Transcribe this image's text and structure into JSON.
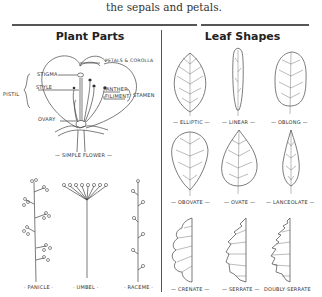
{
  "intro_text": "the sepals and petals.",
  "sections": {
    "plant_parts": {
      "title": "Plant Parts",
      "flower": {
        "caption": "— SIMPLE FLOWER —",
        "labels": {
          "stigma": "STIGMA",
          "style": "STYLE",
          "ovary": "OVARY",
          "pistil": "PISTIL",
          "petals": "PETALS & COROLLA",
          "anther": "ANTHER",
          "filament": "FILIMENT",
          "stamen": "STAMEN"
        }
      },
      "inflorescences": [
        {
          "name": "panicle",
          "caption": "· PANICLE ·"
        },
        {
          "name": "umbel",
          "caption": "· UMBEL ·"
        },
        {
          "name": "raceme",
          "caption": "· RACEME ·"
        }
      ]
    },
    "leaf_shapes": {
      "title": "Leaf Shapes",
      "leaves": [
        {
          "name": "elliptic",
          "caption": "— ELLIPTIC —"
        },
        {
          "name": "linear",
          "caption": "— LINEAR —"
        },
        {
          "name": "oblong",
          "caption": "— OBLONG —"
        },
        {
          "name": "obovate",
          "caption": "— OBOVATE —"
        },
        {
          "name": "ovate",
          "caption": "— OVATE —"
        },
        {
          "name": "lanceolate",
          "caption": "— LANCEOLATE —"
        },
        {
          "name": "crenate",
          "caption": "— CRENATE —"
        },
        {
          "name": "serrate",
          "caption": "— SERRATE —"
        },
        {
          "name": "doubly-serrate",
          "caption": "DOUBLY·SERRATE"
        }
      ]
    }
  }
}
